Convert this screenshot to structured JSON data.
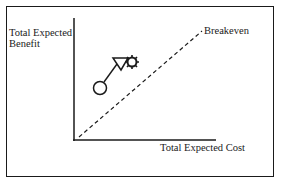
{
  "diagram": {
    "y_axis_label_line1": "Total Expected",
    "y_axis_label_line2": "Benefit",
    "x_axis_label": "Total Expected Cost",
    "breakeven_label": "Breakeven",
    "icons": [
      "circle-node-icon",
      "triangle-node-icon",
      "gear-node-icon"
    ],
    "colors": {
      "ink": "#1a1a1a",
      "background": "#ffffff"
    }
  }
}
